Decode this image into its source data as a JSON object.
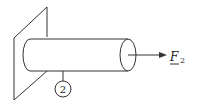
{
  "diagram": {
    "force_label": "F",
    "force_subscript": "2",
    "node_label": "2",
    "elements": [
      "wall",
      "cylinder-bar",
      "force-arrow",
      "node-marker"
    ]
  }
}
